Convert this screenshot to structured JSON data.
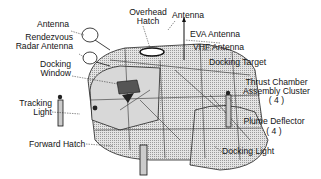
{
  "diagram": {
    "labels": {
      "antenna_left": "Antenna",
      "overhead_hatch_1": "Overhead",
      "overhead_hatch_2": "Hatch",
      "antenna_top": "Antenna",
      "rendezvous_1": "Rendezvous",
      "rendezvous_2": "Radar Antenna",
      "eva_antenna": "EVA Antenna",
      "vhf_antenna": "VHF Antenna",
      "docking_window_1": "Docking",
      "docking_window_2": "Window",
      "docking_target": "Docking Target",
      "thrust_1": "Thrust Chamber",
      "thrust_2": "Assembly Cluster",
      "thrust_count": "( 4 )",
      "tracking_1": "Tracking",
      "tracking_2": "Light",
      "plume_1": "Plume Deflector",
      "plume_count": "( 4 )",
      "forward_hatch": "Forward Hatch",
      "docking_light": "Docking Light"
    }
  }
}
